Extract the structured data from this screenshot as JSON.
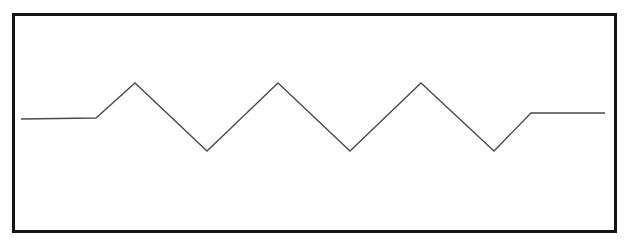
{
  "figure": {
    "title": "Triangular waveform trace",
    "background_color": "#ffffff"
  },
  "frame": {
    "name": "plot-border",
    "stroke_color": "#151515",
    "stroke_width": 3,
    "x": 13.5,
    "y": 14.5,
    "width": 602,
    "height": 217
  },
  "trace": {
    "name": "triangle-wave",
    "stroke_color": "#4a4a4a",
    "stroke_width": 1.3,
    "points": "21,119 96,118 135,83 207,151 278,83 350,151 421,83 494,151 531,113 605,113",
    "vertices": [
      {
        "label": "start-flat-left",
        "x": 21,
        "y": 119
      },
      {
        "label": "rise-onset",
        "x": 96,
        "y": 118
      },
      {
        "label": "peak-1",
        "x": 135,
        "y": 83
      },
      {
        "label": "trough-1",
        "x": 207,
        "y": 151
      },
      {
        "label": "peak-2",
        "x": 278,
        "y": 83
      },
      {
        "label": "trough-2",
        "x": 350,
        "y": 151
      },
      {
        "label": "peak-3",
        "x": 421,
        "y": 83
      },
      {
        "label": "trough-3",
        "x": 494,
        "y": 151
      },
      {
        "label": "settle-knee",
        "x": 531,
        "y": 113
      },
      {
        "label": "end-flat-right",
        "x": 605,
        "y": 113
      }
    ]
  },
  "chart_data": {
    "type": "line",
    "title": "",
    "xlabel": "",
    "ylabel": "",
    "grid": false,
    "legend": null,
    "xlim": [
      21,
      605
    ],
    "ylim": [
      151,
      83
    ],
    "series": [
      {
        "name": "triangle-wave",
        "x": [
          21,
          96,
          135,
          207,
          278,
          350,
          421,
          494,
          531,
          605
        ],
        "y": [
          119,
          118,
          83,
          151,
          83,
          151,
          83,
          151,
          113,
          113
        ]
      }
    ],
    "annotations": [
      "flat baseline segment on the left",
      "three full triangular peaks with three troughs",
      "flat settle segment on the right slightly above the left baseline"
    ]
  }
}
